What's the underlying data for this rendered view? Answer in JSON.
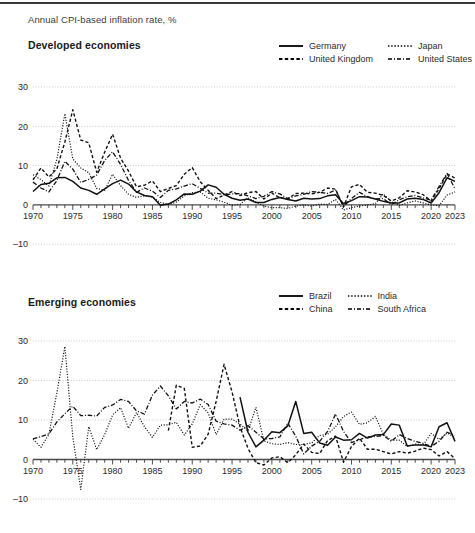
{
  "caption": "Annual CPI-based inflation rate, %",
  "panels": [
    {
      "title": "Developed economies",
      "legend": [
        {
          "label": "Germany",
          "style": "solid"
        },
        {
          "label": "Japan",
          "style": "dotted"
        },
        {
          "label": "United Kingdom",
          "style": "dashed"
        },
        {
          "label": "United States",
          "style": "dashdot"
        }
      ]
    },
    {
      "title": "Emerging economies",
      "legend": [
        {
          "label": "Brazil",
          "style": "solid"
        },
        {
          "label": "India",
          "style": "dotted"
        },
        {
          "label": "China",
          "style": "dashed"
        },
        {
          "label": "South Africa",
          "style": "dashdot"
        }
      ]
    }
  ],
  "chart_data": [
    {
      "type": "line",
      "title": "Developed economies",
      "subtitle": "Annual CPI-based inflation rate, %",
      "xlabel": "",
      "ylabel": "",
      "xlim": [
        1970,
        2023
      ],
      "ylim": [
        -10,
        30
      ],
      "yticks": [
        30,
        20,
        10,
        0,
        -10
      ],
      "xticks": [
        1970,
        1975,
        1980,
        1985,
        1990,
        1995,
        2000,
        2005,
        2010,
        2015,
        2020,
        2023
      ],
      "xtick_minor_step": 1,
      "grid": true,
      "legend_position": "top-right",
      "x": [
        1970,
        1971,
        1972,
        1973,
        1974,
        1975,
        1976,
        1977,
        1978,
        1979,
        1980,
        1981,
        1982,
        1983,
        1984,
        1985,
        1986,
        1987,
        1988,
        1989,
        1990,
        1991,
        1992,
        1993,
        1994,
        1995,
        1996,
        1997,
        1998,
        1999,
        2000,
        2001,
        2002,
        2003,
        2004,
        2005,
        2006,
        2007,
        2008,
        2009,
        2010,
        2011,
        2012,
        2013,
        2014,
        2015,
        2016,
        2017,
        2018,
        2019,
        2020,
        2021,
        2022,
        2023
      ],
      "series": [
        {
          "name": "Germany",
          "style": "solid",
          "values": [
            3.4,
            5.2,
            5.5,
            6.9,
            7.0,
            6.0,
            4.3,
            3.7,
            2.7,
            4.1,
            5.4,
            6.3,
            5.3,
            3.3,
            2.4,
            2.1,
            -0.1,
            0.2,
            1.3,
            2.8,
            2.7,
            3.5,
            5.1,
            4.5,
            2.7,
            1.7,
            1.2,
            1.5,
            0.6,
            0.6,
            1.4,
            1.9,
            1.4,
            1.0,
            1.7,
            1.5,
            1.6,
            2.3,
            2.6,
            0.3,
            1.1,
            2.1,
            2.0,
            1.5,
            0.9,
            0.5,
            0.5,
            1.5,
            1.7,
            1.4,
            0.5,
            3.1,
            6.9,
            6.0
          ]
        },
        {
          "name": "Japan",
          "style": "dotted",
          "values": [
            7.7,
            6.4,
            4.8,
            11.6,
            23.2,
            11.7,
            9.4,
            8.2,
            4.2,
            3.7,
            7.8,
            4.9,
            2.7,
            1.9,
            2.3,
            2.0,
            0.6,
            0.1,
            0.7,
            2.3,
            3.1,
            3.3,
            1.7,
            1.3,
            0.7,
            -0.1,
            0.1,
            1.8,
            0.7,
            -0.3,
            -0.7,
            -0.7,
            -0.9,
            -0.3,
            0.0,
            -0.3,
            0.2,
            0.1,
            1.4,
            -1.3,
            -0.7,
            -0.3,
            0.0,
            0.3,
            2.8,
            0.8,
            -0.1,
            0.5,
            1.0,
            0.5,
            0.0,
            -0.2,
            2.5,
            3.3
          ]
        },
        {
          "name": "United Kingdom",
          "style": "dashed",
          "values": [
            6.4,
            9.4,
            7.1,
            9.2,
            16.0,
            24.2,
            16.5,
            15.8,
            8.3,
            13.4,
            18.0,
            11.9,
            8.6,
            4.6,
            5.0,
            6.1,
            3.4,
            4.2,
            4.9,
            7.8,
            9.5,
            5.9,
            3.7,
            1.6,
            2.5,
            3.4,
            2.4,
            3.1,
            3.4,
            1.5,
            3.0,
            1.8,
            1.6,
            2.9,
            3.0,
            2.8,
            3.2,
            4.3,
            4.0,
            -0.5,
            4.6,
            5.2,
            3.2,
            3.0,
            2.4,
            1.0,
            1.8,
            3.6,
            3.3,
            2.6,
            1.0,
            4.1,
            7.9,
            6.8
          ]
        },
        {
          "name": "United States",
          "style": "dashdot",
          "values": [
            5.8,
            4.3,
            3.3,
            6.2,
            11.1,
            9.1,
            5.7,
            6.5,
            7.6,
            11.3,
            13.5,
            10.3,
            6.2,
            3.2,
            4.3,
            3.5,
            1.9,
            3.7,
            4.1,
            4.8,
            5.4,
            4.2,
            3.0,
            3.0,
            2.6,
            2.8,
            2.9,
            2.3,
            1.6,
            2.2,
            3.4,
            2.8,
            1.6,
            2.3,
            2.7,
            3.4,
            3.2,
            2.9,
            3.8,
            -0.4,
            1.6,
            3.2,
            2.1,
            1.5,
            1.6,
            0.1,
            1.3,
            2.1,
            2.4,
            1.8,
            1.2,
            4.7,
            8.0,
            4.1
          ]
        }
      ]
    },
    {
      "type": "line",
      "title": "Emerging economies",
      "subtitle": "Annual CPI-based inflation rate, %",
      "xlabel": "",
      "ylabel": "",
      "xlim": [
        1970,
        2023
      ],
      "ylim": [
        -10,
        30
      ],
      "yticks": [
        30,
        20,
        10,
        0,
        -10
      ],
      "xticks": [
        1970,
        1975,
        1980,
        1985,
        1990,
        1995,
        2000,
        2005,
        2010,
        2015,
        2020,
        2023
      ],
      "xtick_minor_step": 1,
      "grid": true,
      "legend_position": "top-right",
      "x": [
        1970,
        1971,
        1972,
        1973,
        1974,
        1975,
        1976,
        1977,
        1978,
        1979,
        1980,
        1981,
        1982,
        1983,
        1984,
        1985,
        1986,
        1987,
        1988,
        1989,
        1990,
        1991,
        1992,
        1993,
        1994,
        1995,
        1996,
        1997,
        1998,
        1999,
        2000,
        2001,
        2002,
        2003,
        2004,
        2005,
        2006,
        2007,
        2008,
        2009,
        2010,
        2011,
        2012,
        2013,
        2014,
        2015,
        2016,
        2017,
        2018,
        2019,
        2020,
        2021,
        2022,
        2023
      ],
      "series": [
        {
          "name": "Brazil",
          "style": "solid",
          "start_year": 1996,
          "values": [
            null,
            null,
            null,
            null,
            null,
            null,
            null,
            null,
            null,
            null,
            null,
            null,
            null,
            null,
            null,
            null,
            null,
            null,
            null,
            null,
            null,
            null,
            null,
            null,
            null,
            null,
            15.8,
            6.9,
            3.2,
            4.9,
            7.0,
            6.8,
            8.5,
            14.7,
            6.6,
            6.9,
            4.2,
            3.6,
            5.7,
            4.9,
            5.0,
            6.6,
            5.4,
            6.2,
            6.3,
            9.0,
            8.7,
            3.4,
            3.7,
            3.7,
            3.2,
            8.3,
            9.3,
            4.6
          ]
        },
        {
          "name": "India",
          "style": "dotted",
          "values": [
            5.1,
            3.1,
            6.4,
            16.9,
            28.6,
            5.7,
            -7.6,
            8.3,
            2.5,
            6.3,
            11.3,
            13.1,
            7.9,
            11.9,
            8.3,
            5.6,
            8.7,
            8.8,
            9.4,
            6.2,
            9.0,
            13.9,
            11.8,
            6.3,
            10.2,
            10.2,
            9.0,
            7.2,
            13.2,
            4.7,
            4.0,
            3.8,
            4.3,
            3.8,
            3.8,
            4.2,
            6.1,
            6.4,
            8.3,
            10.9,
            12.0,
            8.9,
            9.3,
            10.9,
            6.4,
            4.9,
            4.9,
            3.3,
            3.9,
            3.7,
            6.6,
            5.1,
            6.7,
            5.6
          ]
        },
        {
          "name": "China",
          "style": "dashed",
          "start_year": 1987,
          "values": [
            null,
            null,
            null,
            null,
            null,
            null,
            null,
            null,
            null,
            null,
            null,
            null,
            null,
            null,
            null,
            null,
            null,
            7.3,
            18.8,
            18.0,
            3.1,
            3.4,
            6.4,
            14.7,
            24.1,
            17.1,
            8.3,
            2.8,
            -0.8,
            -1.4,
            0.4,
            0.7,
            -0.8,
            1.2,
            3.9,
            1.8,
            1.5,
            4.8,
            5.9,
            -0.7,
            3.3,
            5.4,
            2.6,
            2.6,
            2.0,
            1.4,
            2.0,
            1.6,
            2.1,
            2.9,
            2.5,
            0.9,
            2.0,
            0.2
          ]
        },
        {
          "name": "South Africa",
          "style": "dashdot",
          "values": [
            5.2,
            5.8,
            6.5,
            9.5,
            11.6,
            13.5,
            11.1,
            11.2,
            11.0,
            13.2,
            13.8,
            15.2,
            14.7,
            12.3,
            11.5,
            16.3,
            18.6,
            16.1,
            12.8,
            14.7,
            14.3,
            15.3,
            13.9,
            9.7,
            9.0,
            8.7,
            7.4,
            8.6,
            6.9,
            5.2,
            5.3,
            5.7,
            9.2,
            5.9,
            1.4,
            3.4,
            4.6,
            7.1,
            11.5,
            7.1,
            4.3,
            5.0,
            5.7,
            5.8,
            6.1,
            4.6,
            6.3,
            5.3,
            4.6,
            4.1,
            3.3,
            4.6,
            6.9,
            6.1
          ]
        }
      ]
    }
  ]
}
